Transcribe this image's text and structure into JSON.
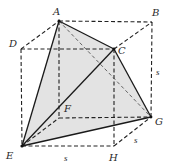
{
  "diagram": {
    "vertices": {
      "A": {
        "label": "A",
        "x": 59,
        "y": 21
      },
      "B": {
        "label": "B",
        "x": 152,
        "y": 22
      },
      "C": {
        "label": "C",
        "x": 114,
        "y": 49
      },
      "D": {
        "label": "D",
        "x": 21,
        "y": 49
      },
      "E": {
        "label": "E",
        "x": 22,
        "y": 146
      },
      "F": {
        "label": "F",
        "x": 59,
        "y": 118
      },
      "G": {
        "label": "G",
        "x": 151,
        "y": 117
      },
      "H": {
        "label": "H",
        "x": 114,
        "y": 146
      }
    },
    "side_labels": {
      "right": "s",
      "bottom": "s",
      "depth": "s"
    },
    "colors": {
      "face_fill": "#e3e3e3",
      "edge": "#1a1a1a"
    }
  }
}
